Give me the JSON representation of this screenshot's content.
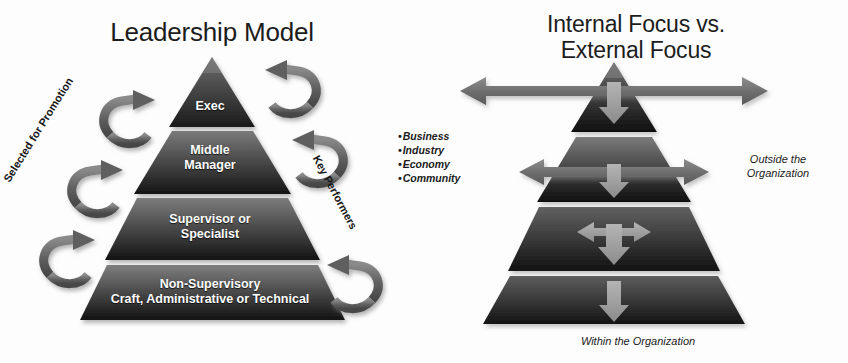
{
  "figure": {
    "background_color": "#fdfdfd",
    "ink_color": "#1a1a1a"
  },
  "left_panel": {
    "title": "Leadership Model",
    "pyramid": {
      "tiers": [
        {
          "id": "exec",
          "label": "Exec",
          "fill_top": "#6e6e6e",
          "fill_bottom": "#1a1a1a"
        },
        {
          "id": "middle",
          "label": "Middle\nManager",
          "fill_top": "#7a7a7a",
          "fill_bottom": "#151515"
        },
        {
          "id": "super",
          "label": "Supervisor or\nSpecialist",
          "fill_top": "#7d7d7d",
          "fill_bottom": "#131313"
        },
        {
          "id": "nonsup",
          "label": "Non-Supervisory\nCraft, Administrative or Technical",
          "fill_top": "#7f7f7f",
          "fill_bottom": "#121212"
        }
      ],
      "tier_labels": {
        "exec": "Exec",
        "middle_line1": "Middle",
        "middle_line2": "Manager",
        "super_line1": "Supervisor or",
        "super_line2": "Specialist",
        "nonsup_line1": "Non-Supervisory",
        "nonsup_line2": "Craft, Administrative or Technical"
      }
    },
    "side_labels": {
      "left": "Selected for Promotion",
      "right": "Key Performers"
    },
    "arrow_color": "#5d5d5d",
    "arrow_count_left": 3,
    "arrow_count_right": 3
  },
  "right_panel": {
    "title_line1": "Internal Focus vs.",
    "title_line2": "External Focus",
    "bullets": [
      "Business",
      "Industry",
      "Economy",
      "Community"
    ],
    "bullet_marker": "•",
    "notes": {
      "outside_line1": "Outside the",
      "outside_line2": "Organization",
      "within": "Within the Organization"
    },
    "pyramid": {
      "tiers": [
        {
          "id": "t1",
          "fill_top": "#6e6e6e",
          "fill_bottom": "#0f0f0f",
          "h_arrow": "wide",
          "v_arrow": true
        },
        {
          "id": "t2",
          "fill_top": "#777777",
          "fill_bottom": "#0f0f0f",
          "h_arrow": "medium",
          "v_arrow": true
        },
        {
          "id": "t3",
          "fill_top": "#5e5e5e",
          "fill_bottom": "#121212",
          "h_arrow": "narrow",
          "v_arrow": true
        },
        {
          "id": "t4",
          "fill_top": "#5a5a5a",
          "fill_bottom": "#141414",
          "h_arrow": "none",
          "v_arrow": true
        }
      ]
    },
    "arrow_color": "#7a7a7a",
    "down_arrow_color": "#9b9b9b"
  }
}
